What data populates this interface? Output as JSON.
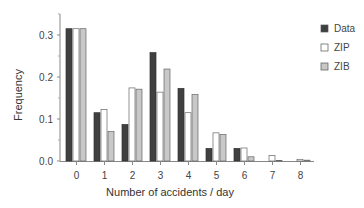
{
  "chart_data": {
    "type": "bar",
    "title": "",
    "xlabel": "Number of accidents / day",
    "ylabel": "Frequency",
    "ylim": [
      0,
      0.35
    ],
    "yticks": [
      "0.0",
      "0.1",
      "0.2",
      "0.3"
    ],
    "categories": [
      "0",
      "1",
      "2",
      "3",
      "4",
      "5",
      "6",
      "7",
      "8"
    ],
    "grid": false,
    "legend_position": "right",
    "series": [
      {
        "name": "Data",
        "color": "#404040",
        "values": [
          0.315,
          0.115,
          0.087,
          0.258,
          0.173,
          0.03,
          0.03,
          0.0,
          0.0
        ]
      },
      {
        "name": "ZIP",
        "color": "#ffffff",
        "values": [
          0.315,
          0.123,
          0.174,
          0.164,
          0.115,
          0.067,
          0.031,
          0.013,
          0.004
        ]
      },
      {
        "name": "ZIB",
        "color": "#c8c8c8",
        "values": [
          0.315,
          0.07,
          0.171,
          0.219,
          0.158,
          0.063,
          0.01,
          0.001,
          0.002
        ]
      }
    ]
  }
}
